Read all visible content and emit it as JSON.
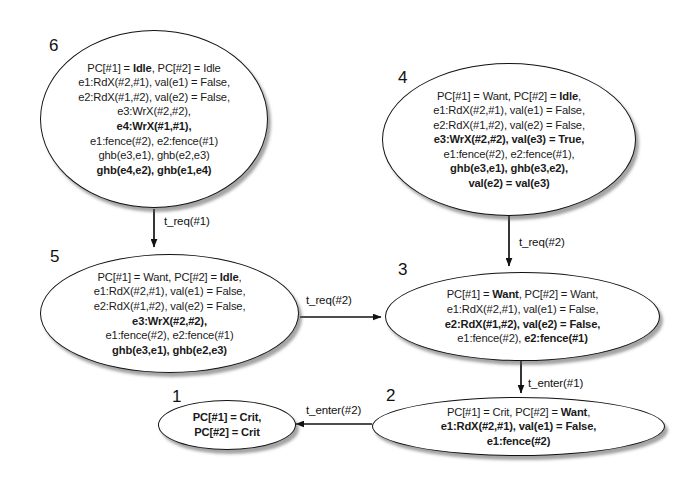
{
  "diagram": {
    "type": "state-transition-graph",
    "title": "",
    "stroke_color": "#121212",
    "fill_color": "#ffffff",
    "shadow_color": "#5a5a5a",
    "nodes": [
      {
        "id": "node-6",
        "number": "6",
        "lines": [
          [
            {
              "t": "PC[#1] = ",
              "b": false
            },
            {
              "t": "Idle",
              "b": true
            },
            {
              "t": ", PC[#2] = Idle",
              "b": false
            }
          ],
          [
            {
              "t": "e1:RdX(#2,#1), val(e1) = False,",
              "b": false
            }
          ],
          [
            {
              "t": "e2:RdX(#1,#2), val(e2) = False,",
              "b": false
            }
          ],
          [
            {
              "t": "e3:WrX(#2,#2),",
              "b": false
            }
          ],
          [
            {
              "t": "e4:WrX(#1,#1),",
              "b": true
            }
          ],
          [
            {
              "t": "e1:fence(#2), e2:fence(#1)",
              "b": false
            }
          ],
          [
            {
              "t": "ghb(e3,e1), ghb(e2,e3)",
              "b": false
            }
          ],
          [
            {
              "t": "ghb(e4,e2), ghb(e1,e4)",
              "b": true
            }
          ]
        ]
      },
      {
        "id": "node-4",
        "number": "4",
        "lines": [
          [
            {
              "t": "PC[#1] = Want, PC[#2] = ",
              "b": false
            },
            {
              "t": "Idle",
              "b": true
            },
            {
              "t": ",",
              "b": false
            }
          ],
          [
            {
              "t": "e1:RdX(#2,#1), val(e1) = False,",
              "b": false
            }
          ],
          [
            {
              "t": "e2:RdX(#1,#2), val(e2) = False,",
              "b": false
            }
          ],
          [
            {
              "t": "e3:WrX(#2,#2), val(e3) = True,",
              "b": true
            }
          ],
          [
            {
              "t": "e1:fence(#2), e2:fence(#1),",
              "b": false
            }
          ],
          [
            {
              "t": "ghb(e3,e1), ghb(e3,e2),",
              "b": true
            }
          ],
          [
            {
              "t": "val(e2) = val(e3)",
              "b": true
            }
          ]
        ]
      },
      {
        "id": "node-5",
        "number": "5",
        "lines": [
          [
            {
              "t": "PC[#1] = Want, PC[#2] = ",
              "b": false
            },
            {
              "t": "Idle",
              "b": true
            },
            {
              "t": ",",
              "b": false
            }
          ],
          [
            {
              "t": "e1:RdX(#2,#1), val(e1) = False,",
              "b": false
            }
          ],
          [
            {
              "t": "e2:RdX(#1,#2), val(e2) = False,",
              "b": false
            }
          ],
          [
            {
              "t": "e3:WrX(#2,#2),",
              "b": true
            }
          ],
          [
            {
              "t": "e1:fence(#2), e2:fence(#1)",
              "b": false
            }
          ],
          [
            {
              "t": "ghb(e3,e1), ghb(e2,e3)",
              "b": true
            }
          ]
        ]
      },
      {
        "id": "node-3",
        "number": "3",
        "lines": [
          [
            {
              "t": "PC[#1] = ",
              "b": false
            },
            {
              "t": "Want",
              "b": true
            },
            {
              "t": ", PC[#2] = Want,",
              "b": false
            }
          ],
          [
            {
              "t": "e1:RdX(#2,#1), val(e1) = False,",
              "b": false
            }
          ],
          [
            {
              "t": "e2:RdX(#1,#2), val(e2) = False,",
              "b": true
            }
          ],
          [
            {
              "t": "e1:fence(#2), ",
              "b": false
            },
            {
              "t": "e2:fence(#1)",
              "b": true
            }
          ]
        ]
      },
      {
        "id": "node-2",
        "number": "2",
        "lines": [
          [
            {
              "t": "PC[#1] = Crit, PC[#2] = ",
              "b": false
            },
            {
              "t": "Want",
              "b": true
            },
            {
              "t": ",",
              "b": false
            }
          ],
          [
            {
              "t": "e1:RdX(#2,#1), val(e1) = False,",
              "b": true
            }
          ],
          [
            {
              "t": "e1:fence(#2)",
              "b": true
            }
          ]
        ]
      },
      {
        "id": "node-1",
        "number": "1",
        "lines": [
          [
            {
              "t": "PC[#1] = Crit,",
              "b": true
            }
          ],
          [
            {
              "t": "PC[#2] = Crit",
              "b": true
            }
          ]
        ]
      }
    ],
    "edges": [
      {
        "id": "edge-6-5",
        "from": "6",
        "to": "5",
        "label": "t_req(#1)"
      },
      {
        "id": "edge-4-3",
        "from": "4",
        "to": "3",
        "label": "t_req(#2)"
      },
      {
        "id": "edge-5-3",
        "from": "5",
        "to": "3",
        "label": "t_req(#2)"
      },
      {
        "id": "edge-3-2",
        "from": "3",
        "to": "2",
        "label": "t_enter(#1)"
      },
      {
        "id": "edge-2-1",
        "from": "2",
        "to": "1",
        "label": "t_enter(#2)"
      }
    ]
  }
}
